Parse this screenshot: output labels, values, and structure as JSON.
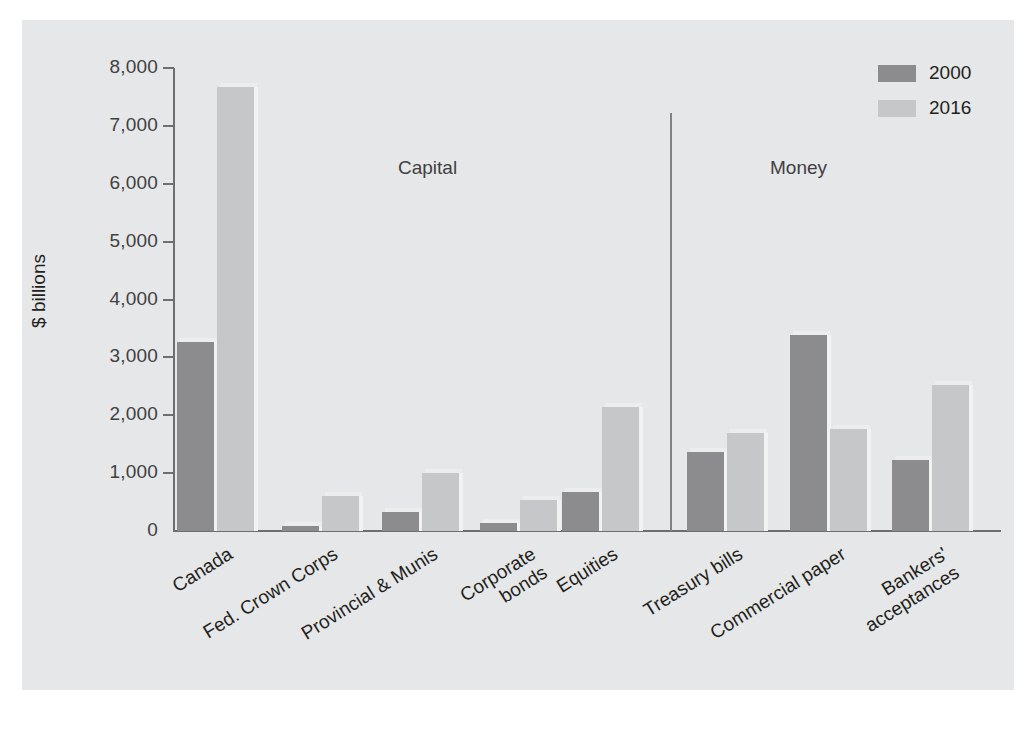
{
  "chart_data": {
    "type": "bar",
    "title": "",
    "xlabel": "",
    "ylabel": "$ billions",
    "ylim": [
      0,
      8000
    ],
    "ytick_labels": [
      "8,000",
      "7,000",
      "6,000",
      "5,000",
      "4,000",
      "3,000",
      "2,000",
      "1,000",
      "0"
    ],
    "ytick_values": [
      8000,
      7000,
      6000,
      5000,
      4000,
      3000,
      2000,
      1000,
      0
    ],
    "grid": false,
    "legend_position": "top-right",
    "categories": [
      "Canada",
      "Fed. Crown Corps",
      "Provincial & Munis",
      "Corporate\nbonds",
      "Equities",
      "Treasury bills",
      "Commercial paper",
      "Bankers'\nacceptances"
    ],
    "series": [
      {
        "name": "2000",
        "color": "#8c8c8e",
        "values": [
          3270,
          80,
          320,
          130,
          670,
          1360,
          3380,
          1220
        ]
      },
      {
        "name": "2016",
        "color": "#c6c7c9",
        "values": [
          7670,
          600,
          1000,
          530,
          2150,
          1690,
          1770,
          2520
        ]
      }
    ],
    "annotations": [
      {
        "text": "Capital",
        "covers": [
          "Canada",
          "Fed. Crown Corps",
          "Provincial & Munis",
          "Corporate bonds",
          "Equities"
        ]
      },
      {
        "text": "Money",
        "covers": [
          "Treasury bills",
          "Commercial paper",
          "Bankers' acceptances"
        ]
      }
    ]
  },
  "legend": {
    "items": [
      {
        "label": "2000"
      },
      {
        "label": "2016"
      }
    ]
  },
  "colors": {
    "background": "#ffffff",
    "panel": "#e6e7e8",
    "axis": "#6d6e71",
    "text": "#231f20",
    "series_2000": "#8c8c8e",
    "series_2016": "#c6c7c9",
    "divider": "#808285"
  }
}
